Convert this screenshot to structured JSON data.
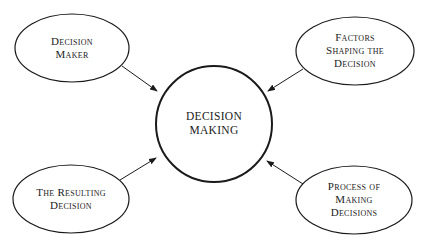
{
  "diagram": {
    "center": {
      "lines": [
        "DECISION",
        "MAKING"
      ]
    },
    "nodes": [
      {
        "id": "decision-maker",
        "position": "top-left",
        "lines": [
          "Decision",
          "Maker"
        ]
      },
      {
        "id": "factors-shaping",
        "position": "top-right",
        "lines": [
          "Factors",
          "Shaping the",
          "Decision"
        ]
      },
      {
        "id": "resulting-decision",
        "position": "bottom-left",
        "lines": [
          "The Resulting",
          "Decision"
        ]
      },
      {
        "id": "process-of-making",
        "position": "bottom-right",
        "lines": [
          "Process of",
          "Making",
          "Decisions"
        ]
      }
    ],
    "edges": [
      {
        "from": "decision-maker",
        "to": "center"
      },
      {
        "from": "factors-shaping",
        "to": "center"
      },
      {
        "from": "resulting-decision",
        "to": "center"
      },
      {
        "from": "process-of-making",
        "to": "center"
      }
    ],
    "colors": {
      "stroke": "#1a1a1a",
      "background": "#ffffff"
    }
  }
}
